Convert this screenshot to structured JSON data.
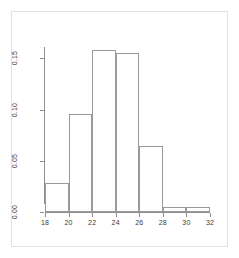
{
  "figure": {
    "background_color": "#ffffff",
    "frame_color": "#e2e2e2",
    "axis_color": "#8e8e8e",
    "bar_border_color": "#9a9a9a",
    "bar_fill_color": "#ffffff"
  },
  "chart_data": {
    "type": "bar",
    "title": "",
    "subtitle": "",
    "xlabel": "",
    "ylabel": "",
    "legend": [],
    "grid": false,
    "legend_position": "none",
    "xlim": [
      18,
      32
    ],
    "ylim": [
      0.0,
      0.16
    ],
    "xticks": [
      18,
      20,
      22,
      24,
      26,
      28,
      30,
      32
    ],
    "xtick_labels": [
      "18",
      "20",
      "22",
      "24",
      "26",
      "28",
      "30",
      "32"
    ],
    "yticks": [
      0.0,
      0.05,
      0.1,
      0.15
    ],
    "ytick_labels": [
      "0.00",
      "0.05",
      "0.10",
      "0.15"
    ],
    "bin_edges": [
      18,
      20,
      22,
      24,
      26,
      28,
      30,
      32
    ],
    "categories": [
      "18-20",
      "20-22",
      "22-24",
      "24-26",
      "26-28",
      "28-30",
      "30-32"
    ],
    "values": [
      0.028,
      0.096,
      0.158,
      0.155,
      0.064,
      0.005,
      0.005
    ],
    "bin_width": 2
  }
}
